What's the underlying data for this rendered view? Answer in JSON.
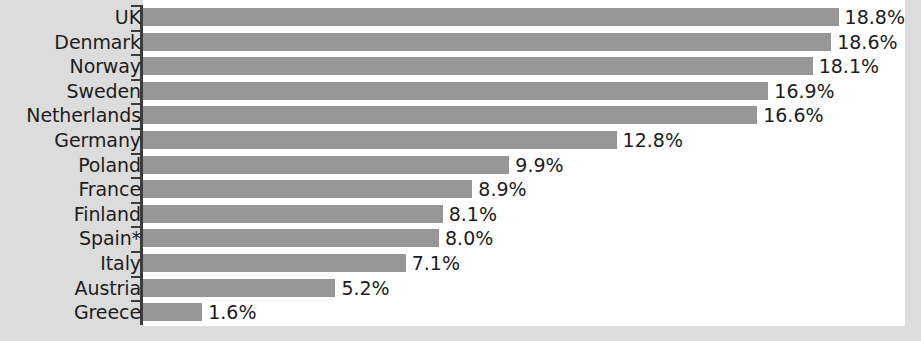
{
  "chart_data": {
    "type": "bar",
    "orientation": "horizontal",
    "title": "",
    "subtitle": "",
    "xlabel": "",
    "ylabel": "",
    "grid": false,
    "legend": null,
    "xlim": [
      0,
      20.6
    ],
    "value_suffix": "%",
    "categories": [
      "UK",
      "Denmark",
      "Norway",
      "Sweden",
      "Netherlands",
      "Germany",
      "Poland",
      "France",
      "Finland",
      "Spain*",
      "Italy",
      "Austria",
      "Greece"
    ],
    "values": [
      18.8,
      18.6,
      18.1,
      16.9,
      16.6,
      12.8,
      9.9,
      8.9,
      8.1,
      8.0,
      7.1,
      5.2,
      1.6
    ],
    "value_labels": [
      "18.8%",
      "18.6%",
      "18.1%",
      "16.9%",
      "16.6%",
      "12.8%",
      "9.9%",
      "8.9%",
      "8.1%",
      "8.0%",
      "7.1%",
      "5.2%",
      "1.6%"
    ],
    "colors": {
      "bar": "#969696",
      "axis": "#3d3d3d",
      "text": "#1c1c1c",
      "plot_background": "#ffffff",
      "page_background": "#dcdcdc"
    }
  }
}
